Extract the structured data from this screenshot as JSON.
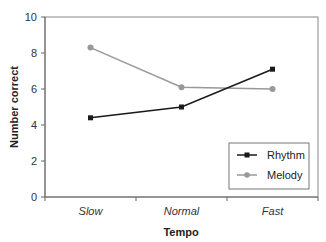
{
  "chart_data": {
    "type": "line",
    "title": "",
    "xlabel": "Tempo",
    "ylabel": "Number correct",
    "categories": [
      "Slow",
      "Normal",
      "Fast"
    ],
    "series": [
      {
        "name": "Rhythm",
        "values": [
          4.4,
          5.0,
          7.1
        ],
        "color": "#1a1a1a",
        "marker": "square"
      },
      {
        "name": "Melody",
        "values": [
          8.3,
          6.1,
          6.0
        ],
        "color": "#999999",
        "marker": "circle"
      }
    ],
    "ylim": [
      0,
      10
    ],
    "yticks": [
      0,
      2,
      4,
      6,
      8,
      10
    ],
    "grid": false,
    "legend_position": "lower right"
  },
  "axes": {
    "xlabel": "Tempo",
    "ylabel": "Number correct",
    "ytick_labels": [
      "0",
      "2",
      "4",
      "6",
      "8",
      "10"
    ],
    "xtick_labels": [
      "Slow",
      "Normal",
      "Fast"
    ]
  },
  "legend": {
    "items": [
      {
        "label": "Rhythm"
      },
      {
        "label": "Melody"
      }
    ]
  }
}
